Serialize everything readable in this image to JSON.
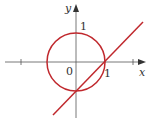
{
  "diagram": {
    "axes": {
      "x_label": "x",
      "y_label": "y",
      "origin_label": "0"
    },
    "tick_labels": {
      "x_one": "1",
      "y_one": "1"
    },
    "shapes": [
      {
        "type": "circle",
        "equation": "x^2 + y^2 = 1",
        "color": "#c0282d"
      },
      {
        "type": "line",
        "equation": "y = x - 1",
        "color": "#c0282d"
      }
    ],
    "colors": {
      "curve": "#c0282d",
      "axis": "#555555"
    }
  }
}
